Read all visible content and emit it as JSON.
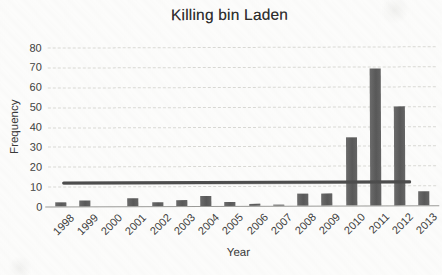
{
  "chart_data": {
    "type": "bar",
    "title": "Killing bin Laden",
    "xlabel": "Year",
    "ylabel": "Frequency",
    "categories": [
      "1998",
      "1999",
      "2000",
      "2001",
      "2002",
      "2003",
      "2004",
      "2005",
      "2006",
      "2007",
      "2008",
      "2009",
      "2010",
      "2011",
      "2012",
      "2013"
    ],
    "values": [
      2,
      3,
      0,
      4,
      2,
      3,
      5,
      2,
      1,
      0.5,
      6,
      6,
      34,
      69,
      50,
      7
    ],
    "yticks": [
      0,
      10,
      20,
      30,
      40,
      50,
      60,
      70,
      80
    ],
    "ylim": [
      0,
      80
    ],
    "grid": true,
    "legend": false,
    "reference_line": {
      "type": "horizontal",
      "value": 12
    },
    "colors": {
      "bar": "#616161",
      "reference_line": "#4c4c4c",
      "gridline": "#d9d9d5",
      "axis_line": "#9b9b98",
      "text": "#3a3a3a",
      "background": "#fcfcfb"
    }
  }
}
